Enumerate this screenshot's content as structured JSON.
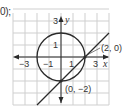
{
  "preceding_text": "0);",
  "graph": {
    "x_range": [
      -4,
      4
    ],
    "y_range": [
      -4,
      4
    ],
    "grid_step": 1,
    "x_axis_label": "x",
    "y_axis_label": "y",
    "x_tick_labels": [
      {
        "value": -3,
        "text": "−3"
      },
      {
        "value": -1,
        "text": "−1"
      },
      {
        "value": 1,
        "text": "1"
      },
      {
        "value": 3,
        "text": "3"
      }
    ],
    "y_tick_labels": [
      {
        "value": 3,
        "text": "3"
      },
      {
        "value": 1,
        "text": "1"
      }
    ],
    "circle": {
      "center": [
        0,
        0
      ],
      "radius": 2,
      "equation": "x^2 + y^2 = 4"
    },
    "line": {
      "slope": 1,
      "intercept": -2,
      "equation": "y = x - 2",
      "x_extent": [
        -2,
        4
      ]
    },
    "points": [
      {
        "x": 2,
        "y": 0,
        "label": "(2, 0)"
      },
      {
        "x": 0,
        "y": -2,
        "label": "(0, −2)"
      }
    ],
    "colors": {
      "grid": "#cfcfcf",
      "curve": "#2a2a2a",
      "text": "#333333"
    }
  }
}
